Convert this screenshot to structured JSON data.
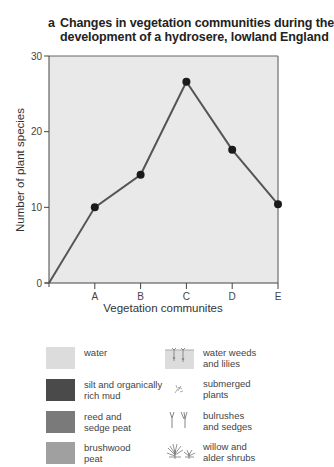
{
  "chart_data": {
    "type": "line",
    "title_letter": "a",
    "title_line1": "Changes in vegetation communities during the",
    "title_line2": "development of a hydrosere, lowland England",
    "title": "Changes in vegetation communities during the development of a hydrosere, lowland England",
    "xlabel": "Vegetation communites",
    "ylabel": "Number of plant species",
    "categories": [
      "",
      "A",
      "B",
      "C",
      "D",
      "E"
    ],
    "x_tick_labels": [
      "A",
      "B",
      "C",
      "D",
      "E"
    ],
    "y_ticks": [
      0,
      10,
      20,
      30
    ],
    "y_tick_labels": [
      "0",
      "10",
      "20",
      "30"
    ],
    "ylim": [
      0,
      30
    ],
    "series": [
      {
        "name": "Number of plant species",
        "values": [
          0,
          10,
          14.3,
          26.6,
          17.6,
          10.4
        ]
      }
    ],
    "grid": false,
    "plot_background": "#e9e9e9",
    "line_color": "#555555",
    "marker_color": "#1a1a1a"
  },
  "legend": {
    "items": [
      {
        "label": "water",
        "swatch": "#dcdcdc",
        "kind": "swatch"
      },
      {
        "label": "silt and organically\nrich mud",
        "swatch": "#4a4a4a",
        "kind": "swatch"
      },
      {
        "label": "reed and\nsedge peat",
        "swatch": "#7a7a7a",
        "kind": "swatch"
      },
      {
        "label": "brushwood\npeat",
        "swatch": "#a0a0a0",
        "kind": "swatch"
      },
      {
        "label": "water weeds\nand lilies",
        "icon": "water-weeds-icon",
        "kind": "icon"
      },
      {
        "label": "submerged\nplants",
        "icon": "submerged-plants-icon",
        "kind": "icon"
      },
      {
        "label": "bulrushes\nand sedges",
        "icon": "bulrushes-icon",
        "kind": "icon"
      },
      {
        "label": "willow and\nalder shrubs",
        "icon": "willow-shrubs-icon",
        "kind": "icon"
      }
    ]
  }
}
